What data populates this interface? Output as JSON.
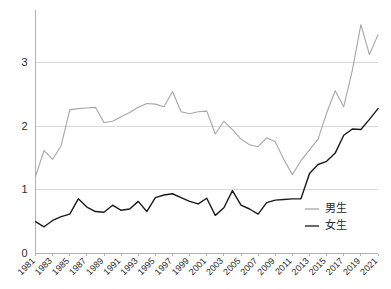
{
  "chart_data": {
    "type": "line",
    "title": "",
    "subtitle": "",
    "xlabel": "",
    "ylabel": "",
    "grid": true,
    "legend_position": "inside-right",
    "xlim": [
      1981,
      2021
    ],
    "ylim": [
      0,
      3.8
    ],
    "y_ticks": [
      "0",
      "1",
      "2",
      "3"
    ],
    "y_tick_values": [
      0,
      1,
      2,
      3
    ],
    "x": [
      1981,
      1982,
      1983,
      1984,
      1985,
      1986,
      1987,
      1988,
      1989,
      1990,
      1991,
      1992,
      1993,
      1994,
      1995,
      1996,
      1997,
      1998,
      1999,
      2000,
      2001,
      2002,
      2003,
      2004,
      2005,
      2006,
      2007,
      2008,
      2009,
      2010,
      2011,
      2012,
      2013,
      2014,
      2015,
      2016,
      2017,
      2018,
      2019,
      2020,
      2021
    ],
    "x_tick_labels": [
      "1981",
      "1983",
      "1985",
      "1987",
      "1989",
      "1991",
      "1993",
      "1995",
      "1997",
      "1999",
      "2001",
      "2003",
      "2005",
      "2007",
      "2009",
      "2011",
      "2013",
      "2015",
      "2017",
      "2019",
      "2021"
    ],
    "series": [
      {
        "name": "男生",
        "color": "#a6a6a6",
        "values": [
          1.21,
          1.62,
          1.48,
          1.7,
          2.26,
          2.28,
          2.29,
          2.3,
          2.06,
          2.08,
          2.15,
          2.22,
          2.3,
          2.36,
          2.35,
          2.31,
          2.55,
          2.23,
          2.2,
          2.23,
          2.24,
          1.88,
          2.08,
          1.95,
          1.8,
          1.71,
          1.68,
          1.82,
          1.76,
          1.48,
          1.24,
          1.46,
          1.63,
          1.8,
          2.21,
          2.56,
          2.31,
          2.88,
          3.6,
          3.13,
          3.44
        ]
      },
      {
        "name": "女生",
        "color": "#1a1a1a",
        "values": [
          0.5,
          0.42,
          0.52,
          0.58,
          0.62,
          0.86,
          0.73,
          0.66,
          0.65,
          0.76,
          0.68,
          0.7,
          0.82,
          0.66,
          0.88,
          0.92,
          0.94,
          0.88,
          0.82,
          0.78,
          0.87,
          0.6,
          0.72,
          0.99,
          0.76,
          0.7,
          0.62,
          0.8,
          0.84,
          0.85,
          0.86,
          0.86,
          1.26,
          1.4,
          1.45,
          1.58,
          1.86,
          1.96,
          1.95,
          2.11,
          2.28
        ]
      }
    ]
  },
  "legend": {
    "items": [
      {
        "label": "男生",
        "color": "#a6a6a6"
      },
      {
        "label": "女生",
        "color": "#1a1a1a"
      }
    ]
  },
  "axes": {
    "y_axis_name": "value-axis",
    "x_axis_name": "year-axis"
  }
}
